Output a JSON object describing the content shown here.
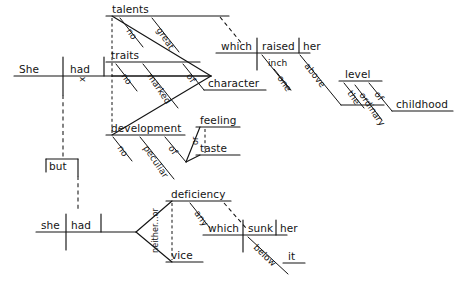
{
  "diagram": {
    "type": "sentence-diagram",
    "clauses": [
      {
        "id": "main-clause-1",
        "subject": "She",
        "verb": "had",
        "compound_marker": "x",
        "objects": [
          {
            "head": "talents",
            "modifiers": [
              "no",
              "great"
            ],
            "relative_clause_link": true
          },
          {
            "head": "traits",
            "modifiers": [
              "no",
              "marked"
            ],
            "prepositional_phrase": {
              "preposition": "of",
              "object": "character"
            }
          },
          {
            "head": "development",
            "modifiers": [
              "no",
              "peculiar"
            ],
            "prepositional_phrase": {
              "preposition": "of",
              "conjunction": "or",
              "objects": [
                "feeling",
                "taste"
              ]
            }
          }
        ],
        "relative_clause": {
          "subject": "which",
          "verb": "raised",
          "object": "her",
          "modifiers": [
            "inch",
            "one"
          ],
          "prepositional_phrases": [
            {
              "preposition": "above",
              "object": "level",
              "modifiers": [
                "the"
              ]
            },
            {
              "preposition": "of",
              "object": "childhood",
              "modifiers": [
                "ordinary"
              ]
            }
          ]
        }
      },
      {
        "id": "main-clause-2",
        "conjunction": "but",
        "subject": "she",
        "verb": "had",
        "correlative_conjunction": "neither...or",
        "objects": [
          {
            "head": "deficiency",
            "modifiers": [
              "any"
            ],
            "relative_clause_link": true
          },
          {
            "head": "vice",
            "modifiers": []
          }
        ],
        "relative_clause": {
          "subject": "which",
          "verb": "sunk",
          "object": "her",
          "prepositional_phrase": {
            "preposition": "below",
            "object": "it"
          }
        }
      }
    ],
    "words": {
      "she_upper": "She",
      "had_1": "had",
      "x_marker": "x",
      "talents": "talents",
      "no_1": "no",
      "great": "great",
      "traits": "traits",
      "no_2": "no",
      "marked": "marked",
      "of_1": "of",
      "character": "character",
      "development": "development",
      "no_3": "no",
      "peculiar": "peculiar",
      "of_2": "of",
      "feeling": "feeling",
      "or_1": "or",
      "taste": "taste",
      "which_1": "which",
      "raised": "raised",
      "her_1": "her",
      "inch": "inch",
      "one": "one",
      "above": "above",
      "the": "the",
      "level": "level",
      "of_3": "of",
      "ordinary": "ordinary",
      "childhood": "childhood",
      "but": "but",
      "she_lower": "she",
      "had_2": "had",
      "neither_or": "neither...or",
      "deficiency": "deficiency",
      "any": "any",
      "vice": "vice",
      "which_2": "which",
      "sunk": "sunk",
      "her_2": "her",
      "below": "below",
      "it": "it"
    },
    "colors": {
      "ink": "#141414",
      "paper": "#ffffff"
    }
  }
}
